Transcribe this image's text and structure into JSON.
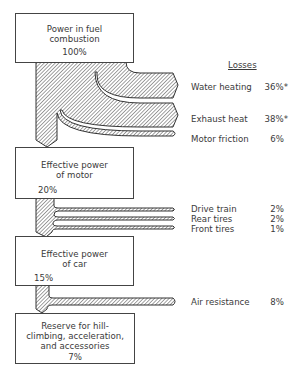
{
  "diagram": {
    "type": "sankey-energy-flow",
    "title": "",
    "losses_header": "Losses",
    "stages": [
      {
        "line1": "Power in fuel",
        "line2": "combustion",
        "line3": "",
        "percent": "100%"
      },
      {
        "line1": "Effective power",
        "line2": "of motor",
        "line3": "",
        "percent": "20%"
      },
      {
        "line1": "Effective power",
        "line2": "of car",
        "line3": "",
        "percent": "15%"
      },
      {
        "line1": "Reserve for hill-",
        "line2": "climbing, acceleration,",
        "line3": "and accessories",
        "percent": "7%"
      }
    ],
    "losses": [
      {
        "label": "Water heating",
        "percent": "36%*"
      },
      {
        "label": "Exhaust heat",
        "percent": "38%*"
      },
      {
        "label": "Motor friction",
        "percent": "6%"
      },
      {
        "label": "Drive train",
        "percent": "2%"
      },
      {
        "label": "Rear tires",
        "percent": "2%"
      },
      {
        "label": "Front tires",
        "percent": "1%"
      },
      {
        "label": "Air resistance",
        "percent": "8%"
      }
    ],
    "colors": {
      "stroke": "#333333",
      "hatch": "#555555",
      "text": "#3a3a3a",
      "background": "#ffffff"
    }
  }
}
